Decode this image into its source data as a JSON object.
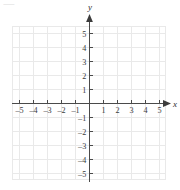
{
  "figure": {
    "kind": "cartesian-coordinate-grid",
    "background_color": "#ffffff",
    "grid_color": "#e9e9e9",
    "axis_color": "#4a4a4a",
    "label_color": "#3b3b3b",
    "x_axis_label": "x",
    "y_axis_label": "y",
    "artifact_mark": "⸺"
  },
  "chart_data": {
    "type": "scatter",
    "title": "",
    "xlabel": "x",
    "ylabel": "y",
    "xlim": [
      -5.8,
      5.8
    ],
    "ylim": [
      -5.8,
      5.8
    ],
    "grid": true,
    "legend": false,
    "x_ticks": [
      -5,
      -4,
      -3,
      -2,
      -1,
      1,
      2,
      3,
      4,
      5
    ],
    "y_ticks": [
      -5,
      -4,
      -3,
      -2,
      -1,
      1,
      2,
      3,
      4,
      5
    ],
    "x_tick_labels": [
      "–5",
      "–4",
      "–3",
      "–2",
      "–1",
      "1",
      "2",
      "3",
      "4",
      "5"
    ],
    "y_tick_labels": [
      "–5",
      "–4",
      "–3",
      "–2",
      "–1",
      "1",
      "2",
      "3",
      "4",
      "5"
    ],
    "series": [
      {
        "name": "",
        "x": [],
        "y": []
      }
    ],
    "annotations": []
  }
}
